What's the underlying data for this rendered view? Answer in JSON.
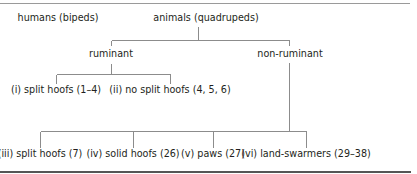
{
  "diagram": {
    "type": "tree",
    "top_level": [
      {
        "id": "humans",
        "label": "humans (bipeds)"
      },
      {
        "id": "animals",
        "label": "animals (quadrupeds)"
      }
    ],
    "animals_children": [
      {
        "id": "ruminant",
        "label": "ruminant"
      },
      {
        "id": "non_ruminant",
        "label": "non-ruminant"
      }
    ],
    "ruminant_children": [
      {
        "id": "i",
        "label": "(i) split hoofs (1–4)"
      },
      {
        "id": "ii",
        "label": "(ii) no split hoofs (4, 5, 6)"
      }
    ],
    "non_ruminant_children": [
      {
        "id": "iii",
        "label": "(iii) split hoofs (7)"
      },
      {
        "id": "iv",
        "label": "(iv) solid hoofs (26)"
      },
      {
        "id": "v",
        "label": "(v) paws (27)"
      },
      {
        "id": "vi",
        "label": "(vi) land-swarmers (29–38)"
      }
    ],
    "edges": [
      [
        "animals",
        "ruminant"
      ],
      [
        "animals",
        "non_ruminant"
      ],
      [
        "ruminant",
        "i"
      ],
      [
        "ruminant",
        "ii"
      ],
      [
        "non_ruminant",
        "iii"
      ],
      [
        "non_ruminant",
        "iv"
      ],
      [
        "non_ruminant",
        "v"
      ],
      [
        "non_ruminant",
        "vi"
      ]
    ]
  }
}
